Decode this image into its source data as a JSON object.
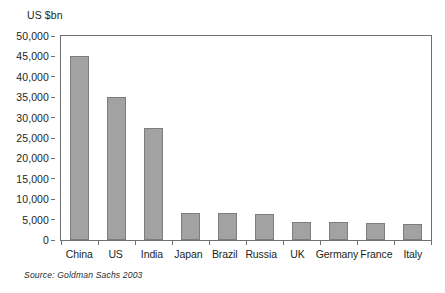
{
  "chart_data": {
    "type": "bar",
    "title": "",
    "subtitle": "",
    "xlabel": "",
    "ylabel": "US $bn",
    "categories": [
      "China",
      "US",
      "India",
      "Japan",
      "Brazil",
      "Russia",
      "UK",
      "Germany",
      "France",
      "Italy"
    ],
    "values": [
      45000,
      35000,
      27500,
      6700,
      6600,
      6400,
      4400,
      4300,
      4200,
      4000
    ],
    "ylim": [
      0,
      50000
    ],
    "ytick_step": 5000,
    "ytick_labels": [
      "50,000",
      "45,000",
      "40,000",
      "35,000",
      "30,000",
      "25,000",
      "20,000",
      "15,000",
      "10,000",
      "5,000",
      "0"
    ],
    "ytick_values": [
      50000,
      45000,
      40000,
      35000,
      30000,
      25000,
      20000,
      15000,
      10000,
      5000,
      0
    ],
    "grid": false,
    "legend": null,
    "legend_position": "none",
    "annotations": [
      "Source: Goldman Sachs 2003"
    ],
    "bar_color": "#a2a2a2",
    "bar_border_color": "#7d7d7d",
    "axis_color": "#6f6f6f"
  },
  "caption": {
    "yaxis_unit": "US $bn",
    "source": "Source:  Goldman Sachs 2003"
  }
}
